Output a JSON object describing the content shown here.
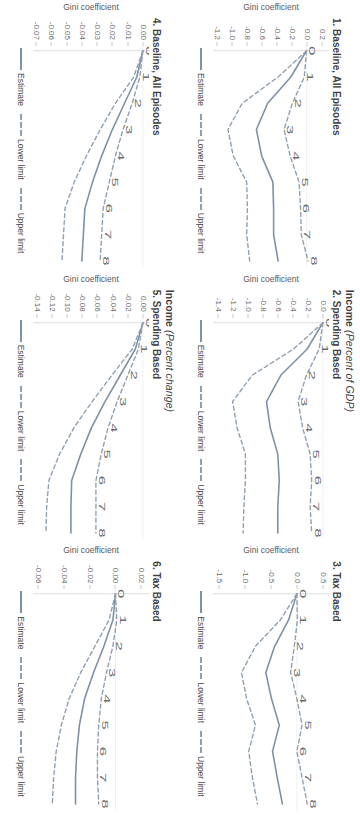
{
  "figure": {
    "column_headers": [
      "",
      "Income (Percent of GDP)",
      ""
    ],
    "column_headers_parts": [
      {
        "main": "",
        "italic": ""
      },
      {
        "main": "Income ",
        "italic": "(Percent of GDP)"
      },
      {
        "main": "",
        "italic": ""
      }
    ],
    "column_headers_row2_parts": [
      {
        "main": "",
        "italic": ""
      },
      {
        "main": "Income ",
        "italic": "(Percent change)"
      },
      {
        "main": "",
        "italic": ""
      }
    ],
    "legend": {
      "estimate": "Estimate",
      "lower_limit": "Lower limit",
      "upper_limit": "Upper limit"
    },
    "axis_label_y": "Gini coefficient",
    "colors": {
      "estimate": "#7f91a5",
      "limits": "#8fa0b2",
      "axis": "#c9c9c9",
      "text": "#3f3f3f",
      "tick_text": "#6b6b6b"
    }
  },
  "chart_data": [
    {
      "id": "panel-1",
      "type": "line",
      "title": "1. Baseline, All Episodes",
      "xlabel": "",
      "ylabel": "Gini coefficient",
      "x": [
        0,
        1,
        2,
        3,
        4,
        5,
        6,
        7,
        8
      ],
      "xticklabels": [
        "0",
        "1",
        "2",
        "3",
        "4",
        "5",
        "6",
        "7",
        "8"
      ],
      "yticklabels": [
        "0.2",
        "0.0",
        "-0.2",
        "-0.4",
        "-0.6",
        "-0.8",
        "-1.0",
        "-1.2"
      ],
      "yticks": [
        0.2,
        0.0,
        -0.2,
        -0.4,
        -0.6,
        -0.8,
        -1.0,
        -1.2
      ],
      "ylim": [
        0.3,
        -1.25
      ],
      "grid": false,
      "series": [
        {
          "name": "Estimate",
          "style": "solid",
          "values": [
            0.0,
            -0.21,
            -0.52,
            -0.67,
            -0.6,
            -0.45,
            -0.44,
            -0.44,
            -0.38
          ]
        },
        {
          "name": "Lower limit",
          "style": "dashed",
          "values": [
            0.0,
            -0.03,
            -0.19,
            -0.3,
            -0.22,
            -0.1,
            -0.08,
            -0.07,
            0.02
          ]
        },
        {
          "name": "Upper limit",
          "style": "dashed",
          "values": [
            0.0,
            -0.38,
            -0.86,
            -1.05,
            -0.98,
            -0.8,
            -0.79,
            -0.8,
            -0.76
          ]
        }
      ]
    },
    {
      "id": "panel-2",
      "type": "line",
      "title": "2. Spending Based",
      "xlabel": "",
      "ylabel": "Gini coefficient",
      "x": [
        0,
        1,
        2,
        3,
        4,
        5,
        6,
        7,
        8
      ],
      "xticklabels": [
        "0",
        "1",
        "2",
        "3",
        "4",
        "5",
        "6",
        "7",
        "8"
      ],
      "yticklabels": [
        "0.0",
        "-0.2",
        "-0.4",
        "-0.6",
        "-0.8",
        "-1.0",
        "-1.2",
        "-1.4"
      ],
      "yticks": [
        0.0,
        -0.2,
        -0.4,
        -0.6,
        -0.8,
        -1.0,
        -1.2,
        -1.4
      ],
      "ylim": [
        0.08,
        -1.46
      ],
      "grid": false,
      "series": [
        {
          "name": "Estimate",
          "style": "solid",
          "values": [
            0.0,
            -0.21,
            -0.56,
            -0.75,
            -0.7,
            -0.6,
            -0.58,
            -0.6,
            -0.6
          ]
        },
        {
          "name": "Lower limit",
          "style": "dashed",
          "values": [
            0.0,
            -0.05,
            -0.22,
            -0.33,
            -0.27,
            -0.17,
            -0.15,
            -0.17,
            -0.15
          ]
        },
        {
          "name": "Upper limit",
          "style": "dashed",
          "values": [
            0.0,
            -0.39,
            -0.94,
            -1.2,
            -1.14,
            -1.03,
            -1.03,
            -1.05,
            -1.06
          ]
        }
      ]
    },
    {
      "id": "panel-3",
      "type": "line",
      "title": "3. Tax Based",
      "xlabel": "",
      "ylabel": "Gini coefficient",
      "x": [
        0,
        1,
        2,
        3,
        4,
        5,
        6,
        7,
        8
      ],
      "xticklabels": [
        "0",
        "1",
        "2",
        "3",
        "4",
        "5",
        "6",
        "7",
        "8"
      ],
      "yticklabels": [
        "0.5",
        "0.0",
        "-0.5",
        "-1.0",
        "-1.5"
      ],
      "yticks": [
        0.5,
        0.0,
        -0.5,
        -1.0,
        -1.5
      ],
      "ylim": [
        0.62,
        -1.62
      ],
      "grid": false,
      "series": [
        {
          "name": "Estimate",
          "style": "solid",
          "values": [
            0.0,
            -0.16,
            -0.43,
            -0.6,
            -0.49,
            -0.34,
            -0.47,
            -0.38,
            -0.28
          ]
        },
        {
          "name": "Lower limit",
          "style": "dashed",
          "values": [
            0.0,
            0.01,
            -0.05,
            -0.12,
            0.0,
            0.1,
            0.0,
            0.1,
            0.2
          ]
        },
        {
          "name": "Upper limit",
          "style": "dashed",
          "values": [
            0.0,
            -0.32,
            -0.8,
            -1.07,
            -0.97,
            -0.8,
            -0.93,
            -0.86,
            -0.76
          ]
        }
      ]
    },
    {
      "id": "panel-4",
      "type": "line",
      "title": "4. Baseline, All Episodes",
      "xlabel": "",
      "ylabel": "Gini coefficient",
      "x": [
        0,
        1,
        2,
        3,
        4,
        5,
        6,
        7,
        8
      ],
      "xticklabels": [
        "0",
        "1",
        "2",
        "3",
        "4",
        "5",
        "6",
        "7",
        "8"
      ],
      "yticklabels": [
        "0.00",
        "-0.01",
        "-0.02",
        "-0.03",
        "-0.04",
        "-0.05",
        "-0.06",
        "-0.07"
      ],
      "yticks": [
        0.0,
        -0.01,
        -0.02,
        -0.03,
        -0.04,
        -0.05,
        -0.06,
        -0.07
      ],
      "ylim": [
        0.004,
        -0.072
      ],
      "grid": false,
      "series": [
        {
          "name": "Estimate",
          "style": "solid",
          "values": [
            0.0,
            -0.004,
            -0.012,
            -0.02,
            -0.027,
            -0.033,
            -0.038,
            -0.039,
            -0.04
          ]
        },
        {
          "name": "Lower limit",
          "style": "dashed",
          "values": [
            0.0,
            -0.002,
            -0.007,
            -0.013,
            -0.018,
            -0.022,
            -0.026,
            -0.027,
            -0.028
          ]
        },
        {
          "name": "Upper limit",
          "style": "dashed",
          "values": [
            0.0,
            -0.006,
            -0.018,
            -0.028,
            -0.037,
            -0.045,
            -0.051,
            -0.052,
            -0.053
          ]
        }
      ]
    },
    {
      "id": "panel-5",
      "type": "line",
      "title": "5. Spending Based",
      "xlabel": "",
      "ylabel": "Gini coefficient",
      "x": [
        0,
        1,
        2,
        3,
        4,
        5,
        6,
        7,
        8
      ],
      "xticklabels": [
        "0",
        "1",
        "2",
        "3",
        "4",
        "5",
        "6",
        "7",
        "8"
      ],
      "yticklabels": [
        "0.00",
        "-0.02",
        "-0.04",
        "-0.06",
        "-0.08",
        "-0.10",
        "-0.12",
        "-0.14"
      ],
      "yticks": [
        0.0,
        -0.02,
        -0.04,
        -0.06,
        -0.08,
        -0.1,
        -0.12,
        -0.14
      ],
      "ylim": [
        0.008,
        -0.145
      ],
      "grid": false,
      "series": [
        {
          "name": "Estimate",
          "style": "solid",
          "values": [
            0.0,
            -0.01,
            -0.03,
            -0.05,
            -0.068,
            -0.082,
            -0.094,
            -0.095,
            -0.095
          ]
        },
        {
          "name": "Lower limit",
          "style": "dashed",
          "values": [
            0.0,
            -0.006,
            -0.02,
            -0.034,
            -0.046,
            -0.055,
            -0.062,
            -0.062,
            -0.062
          ]
        },
        {
          "name": "Upper limit",
          "style": "dashed",
          "values": [
            0.0,
            -0.014,
            -0.041,
            -0.067,
            -0.091,
            -0.11,
            -0.124,
            -0.127,
            -0.128
          ]
        }
      ]
    },
    {
      "id": "panel-6",
      "type": "line",
      "title": "6. Tax Based",
      "xlabel": "",
      "ylabel": "Gini coefficient",
      "x": [
        0,
        1,
        2,
        3,
        4,
        5,
        6,
        7,
        8
      ],
      "xticklabels": [
        "0",
        "1",
        "2",
        "3",
        "4",
        "5",
        "6",
        "7",
        "8"
      ],
      "yticklabels": [
        "0.02",
        "0.00",
        "-0.02",
        "-0.04",
        "-0.06"
      ],
      "yticks": [
        0.02,
        0.0,
        -0.02,
        -0.04,
        -0.06
      ],
      "ylim": [
        0.026,
        -0.064
      ],
      "grid": false,
      "series": [
        {
          "name": "Estimate",
          "style": "solid",
          "values": [
            0.0,
            -0.002,
            -0.009,
            -0.017,
            -0.024,
            -0.028,
            -0.03,
            -0.031,
            -0.031
          ]
        },
        {
          "name": "Lower limit",
          "style": "dashed",
          "values": [
            0.0,
            0.001,
            -0.002,
            -0.007,
            -0.011,
            -0.013,
            -0.014,
            -0.014,
            -0.013
          ]
        },
        {
          "name": "Upper limit",
          "style": "dashed",
          "values": [
            0.0,
            -0.005,
            -0.016,
            -0.027,
            -0.036,
            -0.042,
            -0.046,
            -0.048,
            -0.049
          ]
        }
      ]
    }
  ]
}
